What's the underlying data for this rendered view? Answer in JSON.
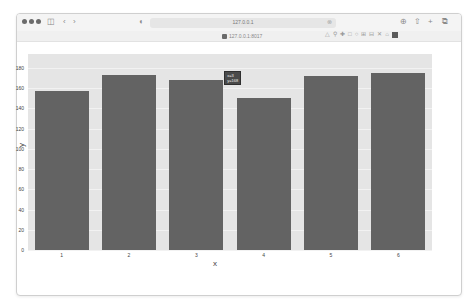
{
  "browser": {
    "url": "127.0.0.1",
    "tab_title": "127.0.0.1:8017",
    "icons": [
      "window-dots",
      "sidebar-icon",
      "back-icon",
      "forward-icon",
      "shield-icon",
      "download-icon",
      "share-icon",
      "new-tab-icon",
      "tabs-icon"
    ]
  },
  "modebar": {
    "icons": [
      "camera-icon",
      "zoom-icon",
      "pan-icon",
      "box-select-icon",
      "lasso-icon",
      "zoom-in-icon",
      "zoom-out-icon",
      "autoscale-icon",
      "reset-axes-icon",
      "plotly-logo-icon"
    ]
  },
  "chart_data": {
    "type": "bar",
    "title": "",
    "xlabel": "x",
    "ylabel": "y",
    "categories": [
      "1",
      "2",
      "3",
      "4",
      "5",
      "6"
    ],
    "values": [
      157,
      173,
      168,
      150,
      172,
      175
    ],
    "ylim": [
      0,
      180
    ],
    "yticks": [
      "0",
      "20",
      "40",
      "60",
      "80",
      "100",
      "120",
      "140",
      "160",
      "180"
    ],
    "grid": true,
    "legend": "none",
    "bar_color": "#636363",
    "plot_bg": "#e5e5e5",
    "hover": {
      "x_label": "x=3",
      "y_label": "y=168"
    }
  }
}
